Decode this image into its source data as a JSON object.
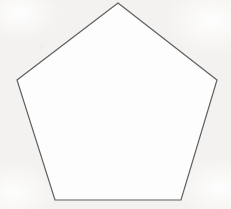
{
  "figure": {
    "canvas": {
      "width": 231,
      "height": 209,
      "background_color": "#f4f2f0",
      "interior_fill": "#fdfdfd",
      "medium": "scanned paper"
    },
    "shape": {
      "name": "pentagon",
      "sides": 5,
      "type": "regular convex polygon",
      "orientation": "apex-up",
      "stroke_color": "#5f5f5f",
      "stroke_width": 1.2,
      "fill_color": "#fdfdfd",
      "vertices": [
        {
          "label": "apex",
          "x": 118,
          "y": 3
        },
        {
          "label": "right",
          "x": 217,
          "y": 80
        },
        {
          "label": "bottom-right",
          "x": 181,
          "y": 200
        },
        {
          "label": "bottom-left",
          "x": 55,
          "y": 200
        },
        {
          "label": "left",
          "x": 17,
          "y": 80
        }
      ],
      "points_attr": "118,3 217,80 181,200 55,200 17,80",
      "interior_angle_deg": 108,
      "exterior_angle_deg": 72,
      "center": {
        "x": 117.6,
        "y": 112.6
      },
      "circumradius": 110,
      "side_length_approx": 126
    },
    "labels": [],
    "annotations": []
  }
}
